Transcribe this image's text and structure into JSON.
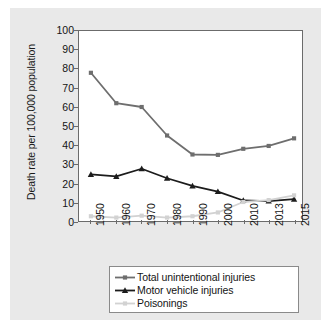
{
  "chart_data": {
    "type": "line",
    "title": "",
    "xlabel": "",
    "ylabel": "Death rate per 100,000 population",
    "categories": [
      "1950",
      "1960",
      "1970",
      "1980",
      "1990",
      "2000",
      "2010",
      "2013",
      "2015"
    ],
    "ylim": [
      0,
      100
    ],
    "yticks": [
      "0",
      "10",
      "20",
      "30",
      "40",
      "50",
      "60",
      "70",
      "80",
      "90",
      "100"
    ],
    "grid": false,
    "legend_position": "below-plot",
    "series": [
      {
        "name": "Total unintentional injuries",
        "color": "#6e6e6e",
        "marker": "square",
        "values": [
          78.0,
          62.0,
          60.0,
          45.0,
          35.0,
          34.8,
          38.0,
          39.5,
          43.5
        ]
      },
      {
        "name": "Motor vehicle injuries",
        "color": "#1c1c1c",
        "marker": "triangle",
        "values": [
          24.5,
          23.5,
          27.5,
          22.5,
          18.5,
          15.5,
          10.8,
          10.5,
          11.5
        ]
      },
      {
        "name": "Poisonings",
        "color": "#d2d2d2",
        "marker": "square",
        "values": [
          2.5,
          1.8,
          2.8,
          1.8,
          2.5,
          4.5,
          10.0,
          11.0,
          13.5
        ]
      }
    ]
  }
}
